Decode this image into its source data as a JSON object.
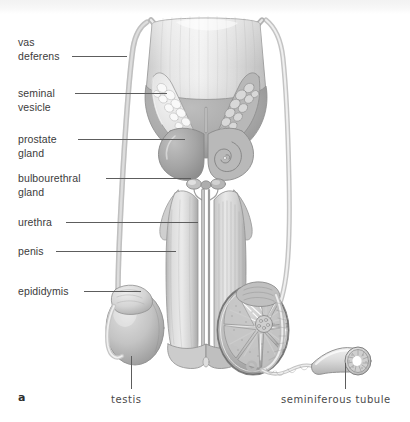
{
  "figure": {
    "letter": "a",
    "background_color": "#ffffff",
    "label_color": "#3b3b3b",
    "leader_color": "#5d5d5d",
    "ink_color": "#8c8c8c"
  },
  "side_labels": [
    {
      "name": "vas-deferens",
      "text": "vas\ndeferens",
      "x": 18,
      "y": 36,
      "line_y": 56,
      "line_x1": 72,
      "line_x2": 127
    },
    {
      "name": "seminal-vesicle",
      "text": "seminal\nvesicle",
      "x": 18,
      "y": 87,
      "line_y": 93,
      "line_x1": 75,
      "line_x2": 167
    },
    {
      "name": "prostate-gland",
      "text": "prostate\ngland",
      "x": 18,
      "y": 133,
      "line_y": 139,
      "line_x1": 78,
      "line_x2": 185
    },
    {
      "name": "bulbourethral-gland",
      "text": "bulbourethral\ngland",
      "x": 18,
      "y": 172,
      "line_y": 178,
      "line_x1": 106,
      "line_x2": 191
    },
    {
      "name": "urethra",
      "text": "urethra",
      "x": 18,
      "y": 216,
      "line_y": 222,
      "line_x1": 66,
      "line_x2": 198
    },
    {
      "name": "penis",
      "text": "penis",
      "x": 18,
      "y": 245,
      "line_y": 251,
      "line_x1": 56,
      "line_x2": 176
    },
    {
      "name": "epididymis",
      "text": "epididymis",
      "x": 18,
      "y": 285,
      "line_y": 291,
      "line_x1": 84,
      "line_x2": 141
    }
  ],
  "bottom_labels": [
    {
      "name": "testis",
      "text": "testis",
      "x": 111,
      "y": 394,
      "line_x": 131,
      "line_y1": 356,
      "line_y2": 389
    },
    {
      "name": "seminiferous-tubule",
      "text": "seminiferous tubule",
      "x": 281,
      "y": 394,
      "line_x": 345,
      "line_y1": 363,
      "line_y2": 389
    }
  ],
  "anatomy_parts": [
    "urinary-bladder",
    "seminal-vesicle-left",
    "seminal-vesicle-right-cutaway",
    "prostate-gland",
    "prostate-cutaway",
    "bulbourethral-glands",
    "penis-shaft",
    "corpus-cavernosum",
    "urethra-channel",
    "glans-penis",
    "vas-deferens-left",
    "vas-deferens-right",
    "testis-left",
    "epididymis-left",
    "testis-right-cross-section",
    "epididymis-right",
    "seminiferous-tubule-magnified"
  ]
}
